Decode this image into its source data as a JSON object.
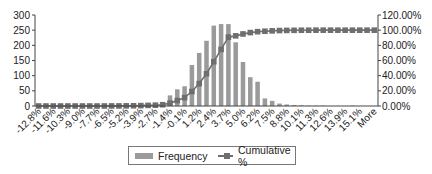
{
  "chart_data": {
    "type": "bar",
    "title": "",
    "xlabel": "",
    "ylabel": "",
    "y2label": "",
    "ylim": [
      0,
      300
    ],
    "y2lim": [
      0,
      120
    ],
    "yticks": [
      "0",
      "50",
      "100",
      "150",
      "200",
      "250",
      "300"
    ],
    "y2ticks": [
      "0.00%",
      "20.00%",
      "40.00%",
      "60.00%",
      "80.00%",
      "100.00%",
      "120.00%"
    ],
    "tick_labels": [
      "-12.8%",
      "-11.6%",
      "-10.3%",
      "-9.0%",
      "-7.7%",
      "-6.5%",
      "-5.2%",
      "-3.9%",
      "-2.7%",
      "-1.4%",
      "-0.1%",
      "1.2%",
      "2.4%",
      "3.7%",
      "5.0%",
      "6.2%",
      "7.5%",
      "8.8%",
      "10.1%",
      "11.3%",
      "12.6%",
      "13.9%",
      "15.1%",
      "More"
    ],
    "grid": false,
    "legend_position": "bottom",
    "bins": 47,
    "series": [
      {
        "name": "Frequency",
        "type": "bar",
        "axis": "left",
        "values": [
          0,
          0,
          0,
          0,
          0,
          0,
          0,
          0,
          0,
          0,
          1,
          1,
          1,
          2,
          3,
          5,
          5,
          10,
          35,
          55,
          65,
          135,
          175,
          215,
          265,
          270,
          270,
          210,
          145,
          95,
          80,
          25,
          17,
          8,
          5,
          3,
          2,
          1,
          1,
          1,
          0,
          0,
          0,
          1,
          0,
          0,
          0
        ]
      },
      {
        "name": "Cumulative %",
        "type": "line",
        "axis": "right",
        "values": [
          0.0,
          0.0,
          0.0,
          0.0,
          0.0,
          0.0,
          0.0,
          0.0,
          0.0,
          0.0,
          0.1,
          0.1,
          0.2,
          0.3,
          0.5,
          0.8,
          1.1,
          1.7,
          3.8,
          7.1,
          11.0,
          19.1,
          29.6,
          42.5,
          58.4,
          74.6,
          90.8,
          92.5,
          95.0,
          96.8,
          98.0,
          98.6,
          99.1,
          99.5,
          99.7,
          99.8,
          99.9,
          99.9,
          100.0,
          100.0,
          100.0,
          100.0,
          100.0,
          100.0,
          100.0,
          100.0,
          100.0
        ]
      }
    ]
  },
  "legend": {
    "items": [
      {
        "label": "Frequency"
      },
      {
        "label": "Cumulative %"
      }
    ]
  },
  "colors": {
    "bar": "#9a9a9a",
    "line": "#6e6e6e",
    "axis": "#444444"
  }
}
